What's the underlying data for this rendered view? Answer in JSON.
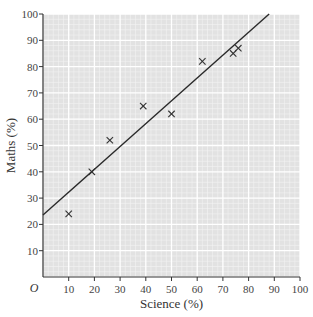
{
  "chart_data": {
    "type": "scatter",
    "title": "",
    "xlabel": "Science (%)",
    "ylabel": "Maths (%)",
    "origin_label": "O",
    "xlim": [
      0,
      100
    ],
    "ylim": [
      0,
      100
    ],
    "x_ticks": [
      10,
      20,
      30,
      40,
      50,
      60,
      70,
      80,
      90,
      100
    ],
    "y_ticks": [
      10,
      20,
      30,
      40,
      50,
      60,
      70,
      80,
      90,
      100
    ],
    "grid": true,
    "marker": "x",
    "points": [
      {
        "x": 10,
        "y": 24
      },
      {
        "x": 19,
        "y": 40
      },
      {
        "x": 26,
        "y": 52
      },
      {
        "x": 39,
        "y": 65
      },
      {
        "x": 50,
        "y": 62
      },
      {
        "x": 62,
        "y": 82
      },
      {
        "x": 74,
        "y": 85
      },
      {
        "x": 76,
        "y": 87
      }
    ],
    "line_of_best_fit": {
      "x1": 0,
      "y1": 23.6,
      "x2": 88,
      "y2": 100
    },
    "colors": {
      "grid_bg": "#e2e2e2",
      "grid_minor": "#f4f4f4",
      "grid_major": "#ffffff",
      "axis": "#333333",
      "marker": "#333333",
      "line": "#2a2a2a"
    }
  }
}
